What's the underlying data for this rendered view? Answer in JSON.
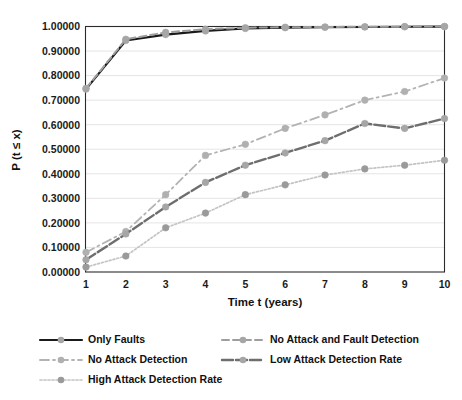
{
  "chart_data": {
    "type": "line",
    "title": "",
    "xlabel": "Time t (years)",
    "ylabel": "P (t ≤ x)",
    "x": [
      1,
      2,
      3,
      4,
      5,
      6,
      7,
      8,
      9,
      10
    ],
    "xlim": [
      1,
      10
    ],
    "ylim": [
      0.0,
      1.0
    ],
    "ytick_labels": [
      "0.00000",
      "0.10000",
      "0.20000",
      "0.30000",
      "0.40000",
      "0.50000",
      "0.60000",
      "0.70000",
      "0.80000",
      "0.90000",
      "1.00000"
    ],
    "ytick_values": [
      0.0,
      0.1,
      0.2,
      0.3,
      0.4,
      0.5,
      0.6,
      0.7,
      0.8,
      0.9,
      1.0
    ],
    "xtick_labels": [
      "1",
      "2",
      "3",
      "4",
      "5",
      "6",
      "7",
      "8",
      "9",
      "10"
    ],
    "grid": "horizontal",
    "legend_position": "bottom",
    "legend_columns": 2,
    "series": [
      {
        "name": "Only Faults",
        "color": "#1a1a1a",
        "marker_color": "#a6a6a6",
        "dash": "none",
        "width": 2.2,
        "values": [
          0.745,
          0.943,
          0.967,
          0.982,
          0.992,
          0.995,
          0.997,
          0.998,
          0.999,
          0.9995
        ]
      },
      {
        "name": "No Attack and Fault Detection",
        "color": "#9e9e9e",
        "marker_color": "#a6a6a6",
        "dash": "7,4",
        "width": 2.0,
        "values": [
          0.748,
          0.948,
          0.976,
          0.989,
          0.995,
          0.997,
          0.998,
          0.999,
          0.9995,
          0.9998
        ]
      },
      {
        "name": "No Attack Detection",
        "color": "#b3b3b3",
        "marker_color": "#b0b0b0",
        "dash": "9,4,2,4",
        "width": 1.8,
        "values": [
          0.08,
          0.165,
          0.315,
          0.475,
          0.52,
          0.585,
          0.64,
          0.7,
          0.735,
          0.79
        ]
      },
      {
        "name": "Low Attack Detection Rate",
        "color": "#6e6e6e",
        "marker_color": "#a6a6a6",
        "dash": "11,3",
        "width": 2.4,
        "values": [
          0.05,
          0.155,
          0.265,
          0.365,
          0.435,
          0.485,
          0.535,
          0.605,
          0.585,
          0.625
        ]
      },
      {
        "name": "High Attack Detection Rate",
        "color": "#c4c4c4",
        "marker_color": "#9a9a9a",
        "dash": "2,2",
        "width": 1.7,
        "values": [
          0.02,
          0.065,
          0.18,
          0.24,
          0.315,
          0.355,
          0.395,
          0.42,
          0.435,
          0.455
        ]
      }
    ]
  },
  "legend": {
    "items": [
      {
        "label": "Only Faults"
      },
      {
        "label": "No Attack and Fault Detection"
      },
      {
        "label": "No Attack Detection"
      },
      {
        "label": "Low Attack Detection Rate"
      },
      {
        "label": "High Attack Detection Rate"
      }
    ]
  },
  "axes": {
    "x_title": "Time t (years)",
    "y_title": "P (t ≤ x)"
  }
}
